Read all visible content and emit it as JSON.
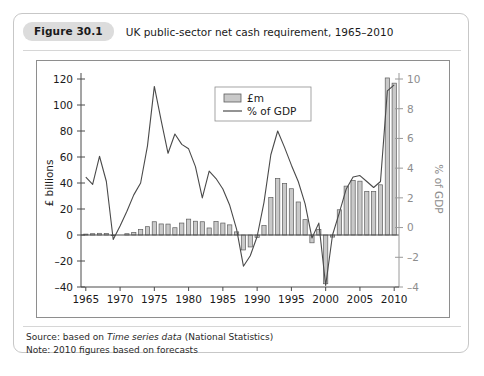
{
  "figure": {
    "badge": "Figure 30.1",
    "title": "UK public-sector net cash requirement, 1965–2010"
  },
  "footer": {
    "source_prefix": "Source: based on ",
    "source_italic": "Time series data",
    "source_suffix": " (National Statistics)",
    "note": "Note: 2010 figures based on forecasts"
  },
  "legend": {
    "bar_label": "£m",
    "line_label": "% of GDP"
  },
  "colors": {
    "bar_fill": "#c9c9c9",
    "bar_stroke": "#5d5d5d",
    "line": "#4a4a4a",
    "left_axis": "#4a4a4a",
    "right_axis": "#9a9a9a",
    "badge_bg": "#dcdcdc",
    "card_border": "#c7c7c7"
  },
  "chart_data": {
    "type": "bar",
    "title": "UK public-sector net cash requirement, 1965–2010",
    "xlabel": "",
    "ylabel": "£ billions",
    "y2label": "% of GDP",
    "ylim": [
      -40,
      120
    ],
    "y2lim": [
      -4,
      10
    ],
    "yticks": [
      -40,
      -20,
      0,
      20,
      40,
      60,
      80,
      100,
      120
    ],
    "yticklabels": [
      "–40",
      "–20",
      "0",
      "20",
      "40",
      "60",
      "80",
      "100",
      "120"
    ],
    "y2ticks": [
      -4,
      -2,
      0,
      2,
      4,
      6,
      8,
      10
    ],
    "y2ticklabels": [
      "–4",
      "–2",
      "0",
      "2",
      "4",
      "6",
      "8",
      "10"
    ],
    "xlim": [
      1964.3,
      2010.7
    ],
    "xticks": [
      1965,
      1970,
      1975,
      1980,
      1985,
      1990,
      1995,
      2000,
      2005,
      2010
    ],
    "xticklabels": [
      "1965",
      "1970",
      "1975",
      "1980",
      "1985",
      "1990",
      "1995",
      "2000",
      "2005",
      "2010"
    ],
    "grid": false,
    "legend_position": "upper-center",
    "categories": [
      1965,
      1966,
      1967,
      1968,
      1969,
      1970,
      1971,
      1972,
      1973,
      1974,
      1975,
      1976,
      1977,
      1978,
      1979,
      1980,
      1981,
      1982,
      1983,
      1984,
      1985,
      1986,
      1987,
      1988,
      1989,
      1990,
      1991,
      1992,
      1993,
      1994,
      1995,
      1996,
      1997,
      1998,
      1999,
      2000,
      2001,
      2002,
      2003,
      2004,
      2005,
      2006,
      2007,
      2008,
      2009,
      2010
    ],
    "series": [
      {
        "name": "£m",
        "axis": "left",
        "unit": "£ billions",
        "values": [
          0.7,
          1.0,
          1.3,
          1.2,
          -0.5,
          -0.4,
          1.0,
          2.0,
          4.2,
          6.4,
          10.2,
          8.5,
          8.4,
          5.6,
          9.2,
          12.2,
          10.6,
          10.2,
          5.4,
          10.4,
          9.2,
          7.8,
          2.4,
          -11.5,
          -9.2,
          -1.8,
          7.2,
          28.8,
          43.4,
          39.6,
          35.6,
          25.4,
          11.8,
          -6.0,
          4.2,
          -37.5,
          -1.6,
          19.4,
          37.6,
          42.0,
          41.4,
          33.6,
          33.4,
          38.6,
          120.8,
          116.8
        ]
      },
      {
        "name": "% of GDP",
        "axis": "right",
        "unit": "% of GDP",
        "values": [
          3.4,
          2.9,
          4.8,
          3.1,
          -0.8,
          0.1,
          1.1,
          2.2,
          3.0,
          5.5,
          9.5,
          7.2,
          5.0,
          6.3,
          5.6,
          5.3,
          4.1,
          2.0,
          3.8,
          3.3,
          2.6,
          1.5,
          -0.1,
          -2.6,
          -1.9,
          -0.6,
          1.7,
          4.9,
          6.5,
          5.4,
          4.2,
          3.1,
          1.6,
          -0.7,
          0.3,
          -3.9,
          -0.5,
          1.0,
          2.6,
          3.4,
          3.5,
          3.1,
          2.7,
          3.1,
          9.2,
          9.6
        ]
      }
    ],
    "annotations": [
      "Peak 1975: £10.2bn, 9.5% of GDP",
      "Peak 1993: £43.4bn, 6.5% of GDP",
      "Trough 2000: –£37.5bn, –3.9% of GDP",
      "Peak 2009: £120.8bn, 9.2% of GDP",
      "2010 forecast: £116.8bn, 9.6% of GDP"
    ]
  }
}
